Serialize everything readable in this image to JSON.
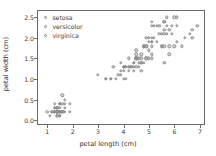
{
  "chart_data": {
    "type": "scatter",
    "title": "",
    "xlabel": "petal length (cm)",
    "ylabel": "petal width (cm)",
    "xlim": [
      0.6,
      7.2
    ],
    "ylim": [
      -0.12,
      2.68
    ],
    "xticks": [
      1,
      2,
      3,
      4,
      5,
      6,
      7
    ],
    "xticklabels": [
      "1",
      "2",
      "3",
      "4",
      "5",
      "6",
      "7"
    ],
    "yticks": [
      0.0,
      0.5,
      1.0,
      1.5,
      2.0,
      2.5
    ],
    "yticklabels": [
      "0.0",
      "0.5",
      "1.0",
      "1.5",
      "2.0",
      "2.5"
    ],
    "grid": false,
    "legend_position": "upper left",
    "marker": "circle-open",
    "marker_color": "#969696",
    "series": [
      {
        "name": "setosa",
        "x": [
          1.4,
          1.4,
          1.3,
          1.5,
          1.4,
          1.7,
          1.4,
          1.5,
          1.4,
          1.5,
          1.5,
          1.6,
          1.4,
          1.1,
          1.2,
          1.5,
          1.3,
          1.4,
          1.7,
          1.5,
          1.7,
          1.5,
          1.0,
          1.7,
          1.9,
          1.6,
          1.6,
          1.5,
          1.4,
          1.6,
          1.6,
          1.5,
          1.5,
          1.4,
          1.5,
          1.2,
          1.3,
          1.4,
          1.3,
          1.5,
          1.3,
          1.3,
          1.3,
          1.6,
          1.9,
          1.4,
          1.6,
          1.4,
          1.5,
          1.4
        ],
        "y": [
          0.2,
          0.2,
          0.2,
          0.2,
          0.2,
          0.4,
          0.3,
          0.2,
          0.2,
          0.1,
          0.2,
          0.2,
          0.1,
          0.1,
          0.2,
          0.4,
          0.4,
          0.3,
          0.3,
          0.3,
          0.2,
          0.4,
          0.2,
          0.5,
          0.2,
          0.2,
          0.4,
          0.2,
          0.2,
          0.2,
          0.2,
          0.4,
          0.1,
          0.2,
          0.2,
          0.2,
          0.2,
          0.1,
          0.2,
          0.2,
          0.3,
          0.3,
          0.2,
          0.6,
          0.4,
          0.3,
          0.2,
          0.2,
          0.2,
          0.2
        ]
      },
      {
        "name": "versicolor",
        "x": [
          4.7,
          4.5,
          4.9,
          4.0,
          4.6,
          4.5,
          4.7,
          3.3,
          4.6,
          3.9,
          3.5,
          4.2,
          4.0,
          4.7,
          3.6,
          4.4,
          4.5,
          4.1,
          4.5,
          3.9,
          4.8,
          4.0,
          4.9,
          4.7,
          4.3,
          4.4,
          4.8,
          5.0,
          4.5,
          3.5,
          3.8,
          3.7,
          3.9,
          5.1,
          4.5,
          4.5,
          4.7,
          4.4,
          4.1,
          4.0,
          4.4,
          4.6,
          4.0,
          3.3,
          4.2,
          4.2,
          4.2,
          4.3,
          3.0,
          4.1
        ],
        "y": [
          1.4,
          1.5,
          1.5,
          1.3,
          1.5,
          1.3,
          1.6,
          1.0,
          1.3,
          1.4,
          1.0,
          1.5,
          1.0,
          1.4,
          1.3,
          1.4,
          1.5,
          1.0,
          1.5,
          1.1,
          1.8,
          1.3,
          1.5,
          1.2,
          1.3,
          1.4,
          1.4,
          1.7,
          1.5,
          1.0,
          1.1,
          1.0,
          1.2,
          1.6,
          1.5,
          1.6,
          1.5,
          1.3,
          1.3,
          1.3,
          1.2,
          1.4,
          1.2,
          1.0,
          1.3,
          1.2,
          1.3,
          1.3,
          1.1,
          1.3
        ]
      },
      {
        "name": "virginica",
        "x": [
          6.0,
          5.1,
          5.9,
          5.6,
          5.8,
          6.6,
          4.5,
          6.3,
          5.8,
          6.1,
          5.1,
          5.3,
          5.5,
          5.0,
          5.1,
          5.3,
          5.5,
          6.7,
          6.9,
          5.0,
          5.7,
          4.9,
          6.7,
          4.9,
          5.7,
          6.0,
          4.8,
          4.9,
          5.6,
          5.8,
          6.1,
          6.4,
          5.6,
          5.1,
          5.6,
          6.1,
          5.6,
          5.5,
          4.8,
          5.4,
          5.6,
          5.1,
          5.1,
          5.9,
          5.7,
          5.2,
          5.0,
          5.2,
          5.4,
          5.1
        ],
        "y": [
          2.5,
          1.9,
          2.1,
          1.8,
          2.2,
          2.1,
          1.7,
          1.8,
          1.8,
          2.5,
          2.0,
          1.9,
          2.1,
          2.0,
          2.4,
          2.3,
          1.8,
          2.2,
          2.3,
          1.5,
          2.3,
          2.0,
          2.0,
          1.8,
          2.1,
          1.8,
          1.8,
          1.8,
          2.1,
          1.6,
          1.9,
          2.0,
          2.2,
          1.5,
          1.4,
          2.3,
          2.4,
          1.8,
          1.8,
          2.1,
          2.4,
          2.3,
          1.9,
          2.3,
          2.5,
          2.3,
          1.9,
          2.0,
          2.3,
          1.8
        ]
      }
    ]
  }
}
